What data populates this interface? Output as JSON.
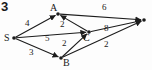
{
  "figure": {
    "number": "3",
    "type": "directed-weighted-graph"
  },
  "style": {
    "stroke_color": "#1c1c1c",
    "node_color": "#1c1c1c",
    "background": "#fdfdfd",
    "stroke_width": 1.1
  },
  "nodes": [
    {
      "id": "S",
      "label": "S",
      "x": 14,
      "y": 38,
      "label_x": 4,
      "label_y": 33
    },
    {
      "id": "A",
      "label": "A",
      "x": 58,
      "y": 14,
      "label_x": 50,
      "label_y": 3
    },
    {
      "id": "B",
      "label": "B",
      "x": 61,
      "y": 58,
      "label_x": 63,
      "label_y": 58
    },
    {
      "id": "C",
      "label": "C",
      "x": 89,
      "y": 32,
      "label_x": 83,
      "label_y": 33
    },
    {
      "id": "T",
      "label": "",
      "x": 144,
      "y": 20,
      "label_x": 146,
      "label_y": 12
    }
  ],
  "edges": [
    {
      "from": "S",
      "to": "A",
      "weight": "4",
      "label_x": 25,
      "label_y": 19
    },
    {
      "from": "S",
      "to": "C",
      "weight": "5",
      "label_x": 45,
      "label_y": 34
    },
    {
      "from": "S",
      "to": "B",
      "weight": "3",
      "label_x": 29,
      "label_y": 48
    },
    {
      "from": "C",
      "to": "A",
      "weight": "2",
      "label_x": 60,
      "label_y": 20
    },
    {
      "from": "B",
      "to": "C",
      "weight": "2",
      "label_x": 62,
      "label_y": 39
    },
    {
      "from": "A",
      "to": "T",
      "weight": "6",
      "label_x": 102,
      "label_y": 3
    },
    {
      "from": "C",
      "to": "T",
      "weight": "8",
      "label_x": 104,
      "label_y": 24
    },
    {
      "from": "B",
      "to": "T",
      "weight": "2",
      "label_x": 104,
      "label_y": 40
    }
  ],
  "graph_data": {
    "type": "diagram",
    "directed": true,
    "weighted": true,
    "node_ids": [
      "S",
      "A",
      "B",
      "C",
      "T"
    ],
    "adjacency": [
      {
        "source": "S",
        "target": "A",
        "capacity": 4
      },
      {
        "source": "S",
        "target": "C",
        "capacity": 5
      },
      {
        "source": "S",
        "target": "B",
        "capacity": 3
      },
      {
        "source": "C",
        "target": "A",
        "capacity": 2
      },
      {
        "source": "B",
        "target": "C",
        "capacity": 2
      },
      {
        "source": "A",
        "target": "T",
        "capacity": 6
      },
      {
        "source": "C",
        "target": "T",
        "capacity": 8
      },
      {
        "source": "B",
        "target": "T",
        "capacity": 2
      }
    ]
  }
}
